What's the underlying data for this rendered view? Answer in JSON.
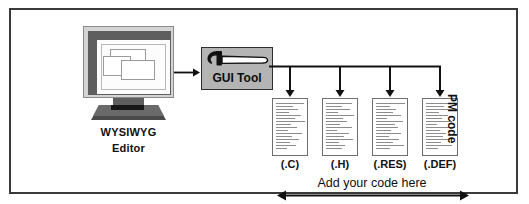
{
  "diagram": {
    "editor": {
      "label_line1": "WYSIWYG",
      "label_line2": "Editor",
      "icon": "crt-monitor-icon",
      "screen_windows": 3
    },
    "tool": {
      "label": "GUI  Tool",
      "icon": "hammer-icon",
      "box_color": "#b4b4b4",
      "border_color": "#2e2e2e"
    },
    "flow_arrow": {
      "icon": "arrow-right-icon",
      "from": "WYSIWYG Editor",
      "to": "GUI Tool"
    },
    "outputs": {
      "group_label": "PM code",
      "documents": [
        {
          "label": "(.C)",
          "icon": "document-icon",
          "line_widths": [
            92,
            58,
            74,
            44,
            84,
            62,
            96,
            50,
            70,
            40,
            88,
            54,
            78,
            46,
            66,
            36
          ]
        },
        {
          "label": "(.H)",
          "icon": "document-icon",
          "line_widths": [
            88,
            52,
            80,
            40,
            94,
            58,
            70,
            48,
            86,
            36,
            76,
            60,
            90,
            44,
            64,
            54
          ]
        },
        {
          "label": "(.RES)",
          "icon": "document-icon",
          "line_widths": [
            96,
            46,
            68,
            56,
            82,
            38,
            90,
            62,
            74,
            50,
            84,
            42,
            78,
            58,
            92,
            48
          ]
        },
        {
          "label": "(.DEF)",
          "icon": "document-icon",
          "line_widths": [
            84,
            60,
            92,
            42,
            72,
            54,
            88,
            38,
            96,
            46,
            66,
            58,
            80,
            50,
            86,
            40
          ]
        }
      ],
      "branch_count": 4
    },
    "footer": {
      "label": "Add  your  code  here",
      "icon": "double-arrow-icon"
    },
    "frame": {
      "border_color": "#3a3a3a",
      "background": "#ffffff"
    }
  }
}
